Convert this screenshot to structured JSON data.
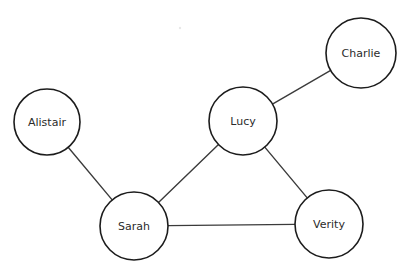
{
  "diagram": {
    "type": "node-link-graph",
    "background_color": "#ffffff",
    "node_fill_color": "#ffffff",
    "node_stroke_color": "#1c1c1c",
    "edge_color": "#3b3b3b",
    "label_color": "#2b2b2b",
    "nodes": [
      {
        "id": "alistair",
        "label": "Alistair",
        "cx": 47,
        "cy": 122,
        "r": 33
      },
      {
        "id": "charlie",
        "label": "Charlie",
        "cx": 361,
        "cy": 53,
        "r": 35
      },
      {
        "id": "lucy",
        "label": "Lucy",
        "cx": 243,
        "cy": 121,
        "r": 34
      },
      {
        "id": "sarah",
        "label": "Sarah",
        "cx": 134,
        "cy": 226,
        "r": 34
      },
      {
        "id": "verity",
        "label": "Verity",
        "cx": 329,
        "cy": 224,
        "r": 34
      }
    ],
    "edges": [
      {
        "id": "alistair-sarah",
        "source": "alistair",
        "target": "sarah"
      },
      {
        "id": "lucy-charlie",
        "source": "lucy",
        "target": "charlie"
      },
      {
        "id": "lucy-sarah",
        "source": "lucy",
        "target": "sarah"
      },
      {
        "id": "lucy-verity",
        "source": "lucy",
        "target": "verity"
      },
      {
        "id": "sarah-verity",
        "source": "sarah",
        "target": "verity"
      }
    ]
  }
}
